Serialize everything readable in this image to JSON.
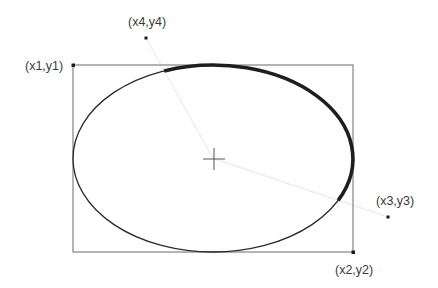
{
  "diagram": {
    "labels": {
      "p1": "(x1,y1)",
      "p2": "(x2,y2)",
      "p3": "(x3,y3)",
      "p4": "(x4,y4)"
    },
    "colors": {
      "box": "#6b6b6b",
      "ellipse": "#2a2a2a",
      "arc": "#1e1e1e",
      "ray": "#e6e6e6",
      "point": "#1a1a1a",
      "crosshair": "#555555"
    },
    "description": {
      "bounding_box": "rectangle from (x1,y1) top-left to (x2,y2) bottom-right",
      "ellipse": "inscribed in bounding box",
      "arc": "bold arc drawn clockwise from ray through (x4,y4) to ray through (x3,y3)",
      "center": "crosshair at ellipse center"
    }
  }
}
